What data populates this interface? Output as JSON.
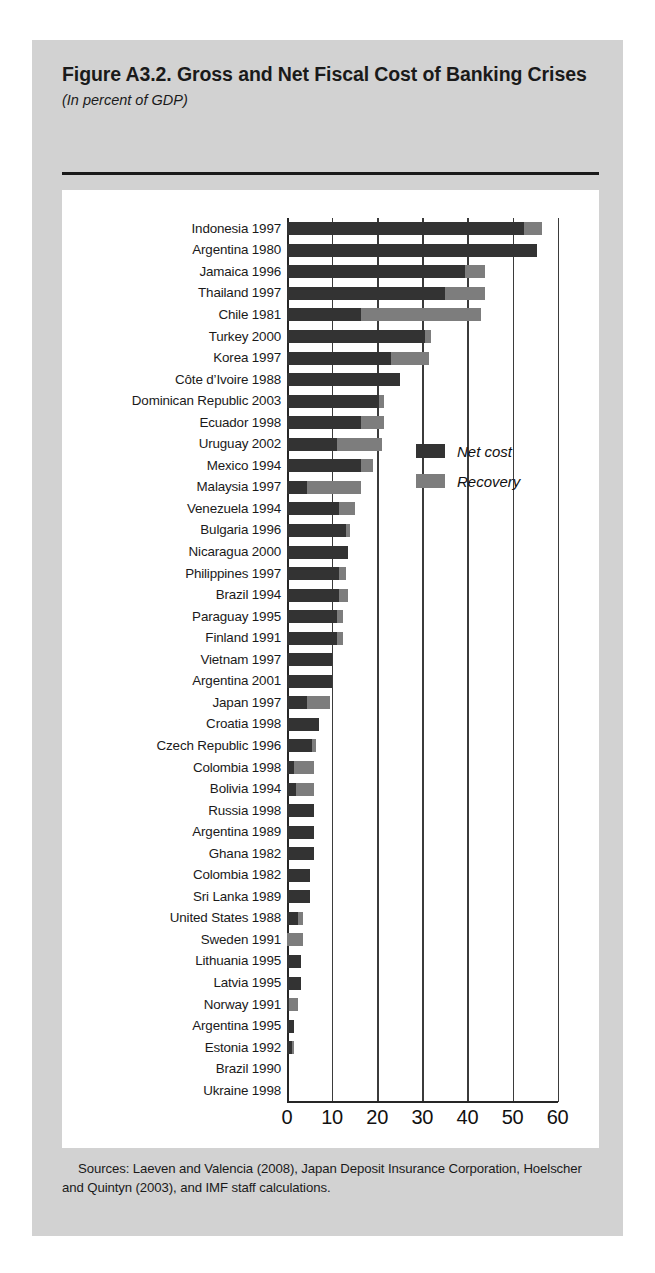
{
  "figure": {
    "title": "Figure A3.2.  Gross and Net Fiscal Cost of Banking Crises",
    "subtitle": "(In percent of GDP)",
    "source": "Sources:  Laeven and Valencia (2008), Japan Deposit Insurance Corporation, Hoelscher and Quintyn (2003), and IMF staff calculations."
  },
  "legend": {
    "net_label": "Net cost",
    "recovery_label": "Recovery",
    "net_color": "#333333",
    "recovery_color": "#7d7d7d"
  },
  "chart_data": {
    "type": "bar",
    "orientation": "horizontal",
    "stacked": true,
    "title": "Figure A3.2.  Gross and Net Fiscal Cost of Banking Crises",
    "subtitle": "(In percent of GDP)",
    "xlabel": "",
    "ylabel": "",
    "xlim": [
      0,
      60
    ],
    "xticks": [
      0,
      10,
      20,
      30,
      40,
      50,
      60
    ],
    "xtick_labels": [
      "0",
      "10",
      "20",
      "30",
      "40",
      "50",
      "60"
    ],
    "grid": true,
    "legend_position": "center-right",
    "categories": [
      "Indonesia 1997",
      "Argentina 1980",
      "Jamaica 1996",
      "Thailand 1997",
      "Chile 1981",
      "Turkey 2000",
      "Korea 1997",
      "Côte d’Ivoire 1988",
      "Dominican Republic 2003",
      "Ecuador 1998",
      "Uruguay 2002",
      "Mexico 1994",
      "Malaysia 1997",
      "Venezuela 1994",
      "Bulgaria 1996",
      "Nicaragua 2000",
      "Philippines 1997",
      "Brazil 1994",
      "Paraguay 1995",
      "Finland 1991",
      "Vietnam 1997",
      "Argentina 2001",
      "Japan 1997",
      "Croatia 1998",
      "Czech Republic 1996",
      "Colombia 1998",
      "Bolivia 1994",
      "Russia 1998",
      "Argentina 1989",
      "Ghana 1982",
      "Colombia 1982",
      "Sri Lanka 1989",
      "United States 1988",
      "Sweden 1991",
      "Lithuania 1995",
      "Latvia 1995",
      "Norway 1991",
      "Argentina 1995",
      "Estonia 1992",
      "Brazil 1990",
      "Ukraine 1998"
    ],
    "series": [
      {
        "name": "Net cost",
        "values": [
          52.5,
          55.5,
          39.5,
          35.0,
          16.5,
          30.5,
          23.0,
          25.0,
          20.5,
          16.5,
          11.0,
          16.5,
          4.5,
          11.5,
          13.0,
          13.5,
          11.5,
          11.5,
          11.0,
          11.0,
          10.0,
          10.0,
          4.5,
          7.0,
          5.5,
          1.5,
          2.0,
          6.0,
          6.0,
          6.0,
          5.0,
          5.0,
          2.5,
          0.0,
          3.0,
          3.0,
          0.5,
          1.5,
          1.0,
          0.0,
          0.0
        ]
      },
      {
        "name": "Recovery",
        "values": [
          4.0,
          0.0,
          4.5,
          9.0,
          26.5,
          1.5,
          8.5,
          0.0,
          1.0,
          5.0,
          10.0,
          2.5,
          12.0,
          3.5,
          1.0,
          0.0,
          1.5,
          2.0,
          1.5,
          1.5,
          0.0,
          0.0,
          5.0,
          0.0,
          1.0,
          4.5,
          4.0,
          0.0,
          0.0,
          0.0,
          0.0,
          0.0,
          1.0,
          3.5,
          0.0,
          0.0,
          2.0,
          0.0,
          0.5,
          0.0,
          0.0
        ]
      }
    ]
  }
}
